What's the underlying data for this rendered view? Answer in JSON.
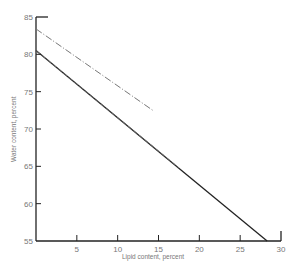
{
  "chart_data": {
    "type": "line",
    "title": "",
    "xlabel": "Lipid content, percent",
    "ylabel": "Water content, percent",
    "xlim": [
      0,
      30
    ],
    "ylim": [
      55,
      85
    ],
    "x_ticks": [
      "5",
      "10",
      "15",
      "20",
      "25",
      "30"
    ],
    "y_ticks": [
      "55",
      "60",
      "65",
      "70",
      "75",
      "80",
      "85"
    ],
    "grid": false,
    "legend": null,
    "series": [
      {
        "name": "solid",
        "style": "solid",
        "x": [
          0,
          28.3
        ],
        "y": [
          80.5,
          55.0
        ]
      },
      {
        "name": "dashed",
        "style": "dashed",
        "x": [
          0,
          17.5
        ],
        "y": [
          80.5,
          64.8
        ]
      },
      {
        "name": "dash-dot",
        "style": "dash-dot",
        "x": [
          0,
          14.3
        ],
        "y": [
          83.4,
          72.5
        ]
      }
    ]
  }
}
